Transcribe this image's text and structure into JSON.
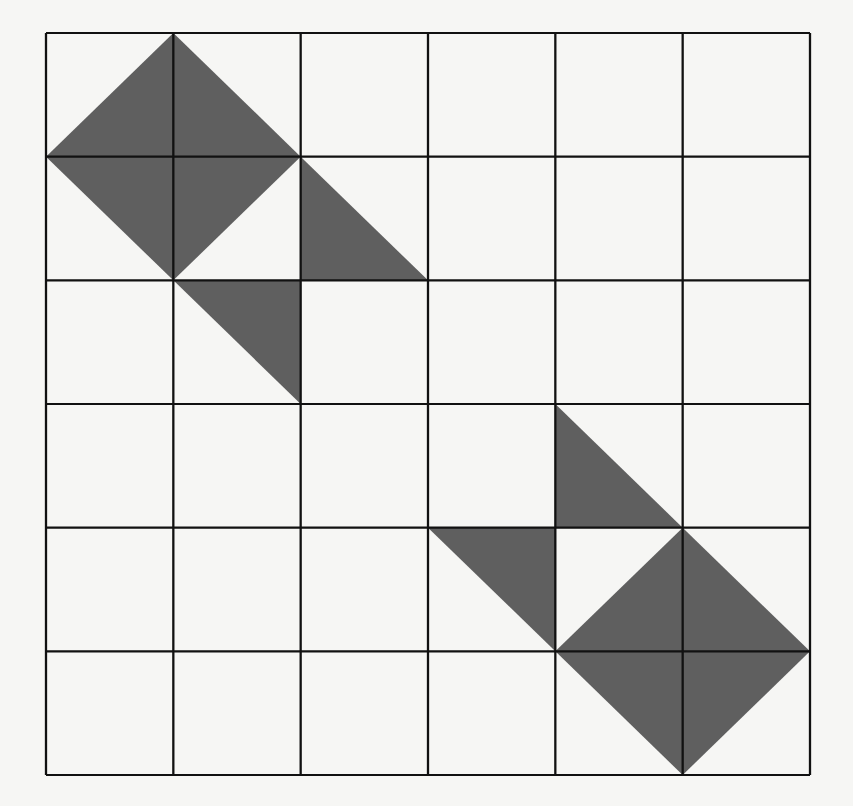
{
  "figure": {
    "type": "grid-with-shaded-triangles",
    "rows": 6,
    "cols": 6,
    "fill_color": "#5f5f5f",
    "line_color": "#111111",
    "background_color": "#f6f6f4",
    "shaded_triangles": [
      [
        [
          0,
          1
        ],
        [
          1,
          0
        ],
        [
          1,
          1
        ]
      ],
      [
        [
          1,
          0
        ],
        [
          2,
          1
        ],
        [
          1,
          1
        ]
      ],
      [
        [
          0,
          1
        ],
        [
          1,
          2
        ],
        [
          1,
          1
        ]
      ],
      [
        [
          1,
          1
        ],
        [
          2,
          1
        ],
        [
          1,
          2
        ]
      ],
      [
        [
          2,
          1
        ],
        [
          3,
          2
        ],
        [
          2,
          2
        ]
      ],
      [
        [
          1,
          2
        ],
        [
          2,
          2
        ],
        [
          2,
          3
        ]
      ],
      [
        [
          4,
          3
        ],
        [
          5,
          4
        ],
        [
          4,
          4
        ]
      ],
      [
        [
          3,
          4
        ],
        [
          4,
          4
        ],
        [
          4,
          5
        ]
      ],
      [
        [
          4,
          5
        ],
        [
          5,
          4
        ],
        [
          5,
          5
        ]
      ],
      [
        [
          5,
          4
        ],
        [
          6,
          5
        ],
        [
          5,
          5
        ]
      ],
      [
        [
          4,
          5
        ],
        [
          5,
          6
        ],
        [
          5,
          5
        ]
      ],
      [
        [
          5,
          5
        ],
        [
          6,
          5
        ],
        [
          5,
          6
        ]
      ]
    ]
  }
}
